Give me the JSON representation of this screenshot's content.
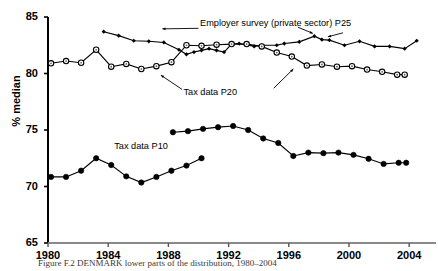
{
  "figure": {
    "caption": "Figure F.2  DENMARK lower parts of the distribution, 1980–2004"
  },
  "chart_data": {
    "type": "line",
    "title": "",
    "xlabel": "",
    "ylabel": "% median",
    "xlim": [
      1980,
      2005
    ],
    "ylim": [
      65,
      85
    ],
    "grid": false,
    "legend_position": "inline-annotations",
    "xticks": [
      "1980",
      "1984",
      "1988",
      "1992",
      "1996",
      "2000",
      "2004"
    ],
    "yticks": [
      "65",
      "70",
      "75",
      "80",
      "85"
    ],
    "series": [
      {
        "name": "Employer survey (private sector) P25",
        "marker": "small-diamond",
        "x": [
          1983.7,
          1984.7,
          1985.7,
          1986.7,
          1987.7,
          1988.7,
          1989.2,
          1989.7,
          1990.2,
          1990.7,
          1991.2,
          1991.7,
          1992.2,
          1992.7,
          1993.2,
          1993.7,
          1994.2,
          1995.2,
          1995.7,
          1996.7,
          1997.7,
          1998.2,
          1998.7,
          1999.7,
          2000.7,
          2001.7,
          2002.7,
          2003.7,
          2004.5
        ],
        "values": [
          83.7,
          83.35,
          82.9,
          82.85,
          82.75,
          82.1,
          81.7,
          81.9,
          82.05,
          82.2,
          82.05,
          81.9,
          82.6,
          82.65,
          82.55,
          82.4,
          82.5,
          82.5,
          82.65,
          82.8,
          83.3,
          83.0,
          82.95,
          82.5,
          82.85,
          82.4,
          82.4,
          82.2,
          82.9
        ]
      },
      {
        "name": "Tax data P20",
        "marker": "open-circle",
        "x": [
          1980.2,
          1981.2,
          1982.2,
          1983.2,
          1984.2,
          1985.2,
          1986.2,
          1987.2,
          1988.2,
          1989.2,
          1990.2,
          1991.2,
          1992.2,
          1993.2,
          1994.2,
          1995.2,
          1996.2,
          1997.2,
          1998.2,
          1999.2,
          2000.2,
          2001.2,
          2002.2,
          2003.2,
          2003.7
        ],
        "values": [
          80.9,
          81.1,
          80.95,
          82.1,
          80.6,
          80.85,
          80.4,
          80.65,
          81.0,
          82.5,
          82.45,
          82.55,
          82.6,
          82.6,
          82.4,
          81.85,
          81.5,
          80.7,
          80.8,
          80.6,
          80.65,
          80.35,
          80.15,
          79.9,
          79.9
        ]
      },
      {
        "name": "Tax data P10",
        "marker": "filled-circle",
        "x": [
          1980.2,
          1981.2,
          1982.2,
          1983.2,
          1984.2,
          1985.2,
          1986.2,
          1987.2,
          1988.2,
          1989.2,
          1990.2
        ],
        "values": [
          70.85,
          70.85,
          71.4,
          72.5,
          71.9,
          70.9,
          70.35,
          70.85,
          71.4,
          71.85,
          72.5
        ]
      },
      {
        "name": "Tax data P10 (continued)",
        "marker": "filled-circle",
        "x": [
          1988.3,
          1989.3,
          1990.3,
          1991.3,
          1992.3,
          1993.3,
          1994.3,
          1995.3,
          1996.3,
          1997.3,
          1998.3,
          1999.3,
          2000.3,
          2001.3,
          2002.3,
          2003.3,
          2003.8
        ],
        "values": [
          74.8,
          74.9,
          75.1,
          75.25,
          75.35,
          75.0,
          74.25,
          73.85,
          72.7,
          73.0,
          72.95,
          73.0,
          72.8,
          72.45,
          72.0,
          72.1,
          72.1
        ]
      }
    ],
    "annotations": [
      {
        "text": "Employer survey (private sector) P25",
        "x": 1990.1,
        "y": 84.35
      },
      {
        "text": "Tax data P20",
        "x": 1989.0,
        "y": 78.3
      },
      {
        "text": "Tax data P10",
        "x": 1984.4,
        "y": 73.5
      }
    ]
  }
}
